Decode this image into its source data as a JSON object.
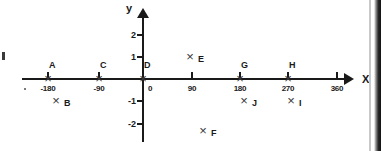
{
  "figure": {
    "axis_names": {
      "x": "X",
      "y": "y"
    },
    "colors": {
      "axis": "#1a1a1a",
      "marker": "#3a3a3a",
      "label": "#1a1a1a"
    }
  },
  "chart_data": {
    "type": "scatter",
    "title": "",
    "xlabel": "X",
    "ylabel": "y",
    "xlim": [
      -215,
      380
    ],
    "ylim": [
      -2.6,
      2.6
    ],
    "grid": false,
    "legend": null,
    "xticks": [
      -180,
      -90,
      0,
      90,
      180,
      270,
      360
    ],
    "xtick_labels": [
      "-180",
      "-90",
      "0",
      "90",
      "180",
      "270",
      "360"
    ],
    "yticks": [
      2,
      1,
      -1,
      -2
    ],
    "ytick_labels": [
      "2",
      "1",
      "-1",
      "-2"
    ],
    "points": [
      {
        "label": "A",
        "x": -180,
        "y": 0,
        "label_pos": "above"
      },
      {
        "label": "B",
        "x": -165,
        "y": -1,
        "label_pos": "right"
      },
      {
        "label": "C",
        "x": -90,
        "y": 0,
        "label_pos": "above"
      },
      {
        "label": "D",
        "x": 0,
        "y": 0,
        "label_pos": "above"
      },
      {
        "label": "E",
        "x": 100,
        "y": 1,
        "label_pos": "right"
      },
      {
        "label": "F",
        "x": 113,
        "y": -2,
        "label_pos": "right"
      },
      {
        "label": "G",
        "x": 180,
        "y": 0,
        "label_pos": "above"
      },
      {
        "label": "H",
        "x": 270,
        "y": 0,
        "label_pos": "above"
      },
      {
        "label": "I",
        "x": 277,
        "y": -1,
        "label_pos": "right"
      },
      {
        "label": "J",
        "x": 187,
        "y": -1,
        "label_pos": "right"
      }
    ],
    "marker_glyph": "×"
  },
  "ticks": {
    "x": [
      {
        "value": "-180",
        "px": 48
      },
      {
        "value": "-90",
        "px": 99
      },
      {
        "value": "0",
        "px": 147
      },
      {
        "value": "90",
        "px": 192
      },
      {
        "value": "180",
        "px": 240
      },
      {
        "value": "270",
        "px": 288
      },
      {
        "value": "360",
        "px": 337
      }
    ],
    "y": [
      {
        "value": "2",
        "px": 35
      },
      {
        "value": "1",
        "px": 57
      },
      {
        "value": "-1",
        "px": 101
      },
      {
        "value": "-2",
        "px": 124
      }
    ]
  },
  "markers": [
    {
      "name": "point-a",
      "glyph": "×",
      "label": "A",
      "left": 48,
      "top": 79,
      "label_pos": "above"
    },
    {
      "name": "point-b",
      "glyph": "×",
      "label": "B",
      "left": 56,
      "top": 101,
      "label_pos": "right"
    },
    {
      "name": "point-c",
      "glyph": "×",
      "label": "C",
      "left": 99,
      "top": 79,
      "label_pos": "above"
    },
    {
      "name": "point-d",
      "glyph": "×",
      "label": "D",
      "left": 143,
      "top": 79,
      "label_pos": "above"
    },
    {
      "name": "point-e",
      "glyph": "×",
      "label": "E",
      "left": 190,
      "top": 57,
      "label_pos": "right"
    },
    {
      "name": "point-f",
      "glyph": "×",
      "label": "F",
      "left": 203,
      "top": 131,
      "label_pos": "right"
    },
    {
      "name": "point-g",
      "glyph": "×",
      "label": "G",
      "left": 240,
      "top": 79,
      "label_pos": "above"
    },
    {
      "name": "point-h",
      "glyph": "×",
      "label": "H",
      "left": 288,
      "top": 79,
      "label_pos": "above"
    },
    {
      "name": "point-i",
      "glyph": "×",
      "label": "I",
      "left": 291,
      "top": 101,
      "label_pos": "right"
    },
    {
      "name": "point-j",
      "glyph": "×",
      "label": "J",
      "left": 244,
      "top": 101,
      "label_pos": "right"
    }
  ]
}
